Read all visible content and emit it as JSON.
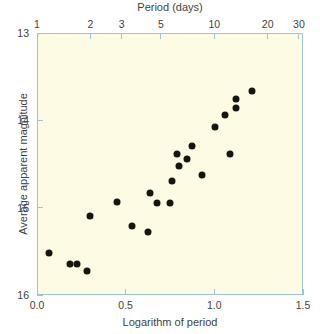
{
  "chart_data": {
    "type": "scatter",
    "title": "",
    "xlabel": "Logarithm of period",
    "ylabel": "Average apparent magnitude",
    "toplabel": "Period (days)",
    "xlim": [
      0.0,
      1.5
    ],
    "ylim": [
      16,
      13
    ],
    "y_inverted": true,
    "grid": false,
    "legend": null,
    "xticks": [
      "0.0",
      "0.5",
      "1.0",
      "1.5"
    ],
    "xtick_values": [
      0.0,
      0.5,
      1.0,
      1.5
    ],
    "yticks": [
      "13",
      "14",
      "15",
      "16"
    ],
    "ytick_values": [
      13,
      14,
      15,
      16
    ],
    "top_axis": {
      "label": "Period (days)",
      "scale": "log10",
      "ticks": [
        "1",
        "2",
        "3",
        "5",
        "10",
        "20",
        "30"
      ],
      "tick_values": [
        1,
        2,
        3,
        5,
        10,
        20,
        30
      ],
      "tick_log_positions": [
        0.0,
        0.301,
        0.477,
        0.699,
        1.0,
        1.301,
        1.477
      ]
    },
    "points": [
      {
        "x": 0.068,
        "y": 15.52
      },
      {
        "x": 0.186,
        "y": 15.64
      },
      {
        "x": 0.226,
        "y": 15.64
      },
      {
        "x": 0.282,
        "y": 15.73
      },
      {
        "x": 0.299,
        "y": 15.1
      },
      {
        "x": 0.451,
        "y": 14.94
      },
      {
        "x": 0.536,
        "y": 15.21
      },
      {
        "x": 0.626,
        "y": 15.28
      },
      {
        "x": 0.637,
        "y": 14.83
      },
      {
        "x": 0.677,
        "y": 14.95
      },
      {
        "x": 0.75,
        "y": 14.95
      },
      {
        "x": 0.762,
        "y": 14.7
      },
      {
        "x": 0.79,
        "y": 14.39
      },
      {
        "x": 0.8,
        "y": 14.52
      },
      {
        "x": 0.846,
        "y": 14.44
      },
      {
        "x": 0.873,
        "y": 14.29
      },
      {
        "x": 0.93,
        "y": 14.63
      },
      {
        "x": 1.002,
        "y": 14.08
      },
      {
        "x": 1.061,
        "y": 13.94
      },
      {
        "x": 1.09,
        "y": 14.39
      },
      {
        "x": 1.122,
        "y": 13.86
      },
      {
        "x": 1.122,
        "y": 13.76
      },
      {
        "x": 1.212,
        "y": 13.66
      }
    ]
  }
}
